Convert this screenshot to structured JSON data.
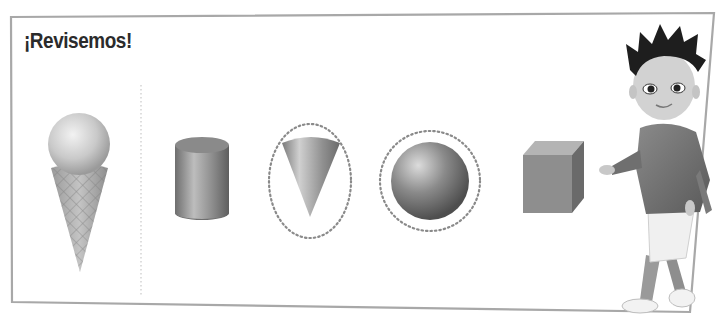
{
  "header": {
    "title": "¡Revisemos!"
  },
  "activity": {
    "reference_object": {
      "name": "ice cream cone",
      "description": "sphere on top of a cone"
    },
    "shapes": [
      {
        "name": "cylinder",
        "circled": false
      },
      {
        "name": "cone",
        "circled": true
      },
      {
        "name": "sphere",
        "circled": true
      },
      {
        "name": "cube",
        "circled": false
      }
    ]
  },
  "character": {
    "name": "boy character",
    "pose": "pointing at shapes"
  },
  "colors": {
    "frame": "#a8a8a8",
    "title": "#2b2b2b",
    "dotted": "#8a8a8a"
  }
}
